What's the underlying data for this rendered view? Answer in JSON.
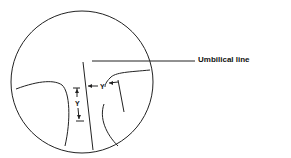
{
  "diagram": {
    "callout_label": "Umbilical line",
    "dimension_labels": {
      "vertical": "Y",
      "horizontal": "Y"
    },
    "colors": {
      "line": "#222222",
      "background": "#ffffff"
    }
  }
}
